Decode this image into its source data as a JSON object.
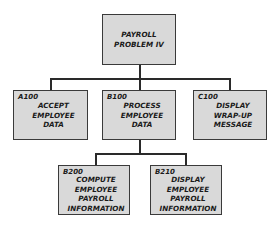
{
  "diagram": {
    "type": "hierarchy-chart",
    "root": {
      "code": "",
      "label": "PAYROLL\nPROBLEM IV"
    },
    "level2": [
      {
        "code": "A100",
        "label": "ACCEPT\nEMPLOYEE\nDATA"
      },
      {
        "code": "B100",
        "label": "PROCESS\nEMPLOYEE\nDATA"
      },
      {
        "code": "C100",
        "label": "DISPLAY\nWRAP-UP\nMESSAGE"
      }
    ],
    "level3": [
      {
        "code": "B200",
        "label": "COMPUTE\nEMPLOYEE\nPAYROLL\nINFORMATION",
        "parent": "B100"
      },
      {
        "code": "B210",
        "label": "DISPLAY\nEMPLOYEE\nPAYROLL\nINFORMATION",
        "parent": "B100"
      }
    ]
  }
}
